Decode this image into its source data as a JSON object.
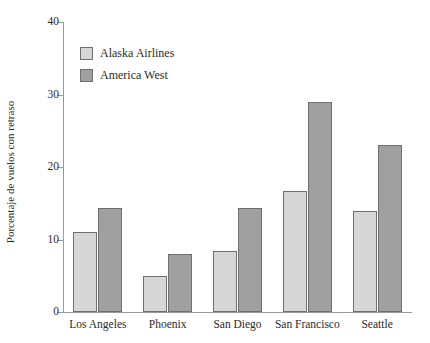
{
  "chart_data": {
    "type": "bar",
    "title": "",
    "xlabel": "",
    "ylabel": "Porcentaje de vuelos con retraso",
    "ylim": [
      0,
      40
    ],
    "yticks": [
      0,
      10,
      20,
      30,
      40
    ],
    "grid": false,
    "legend_position": "top-left inside plot",
    "categories": [
      "Los Angeles",
      "Phoenix",
      "San Diego",
      "San Francisco",
      "Seattle"
    ],
    "series": [
      {
        "name": "Alaska Airlines",
        "color": "#d6d6d6",
        "values": [
          11,
          5,
          8.4,
          16.7,
          14
        ]
      },
      {
        "name": "America West",
        "color": "#a0a0a0",
        "values": [
          14.3,
          8,
          14.3,
          29,
          23
        ]
      }
    ]
  },
  "style": {
    "background": "#ffffff",
    "axis_color": "#9a9a9a",
    "bar_edge_color": "#6f6f6f",
    "text_color": "#2b2b2b"
  }
}
